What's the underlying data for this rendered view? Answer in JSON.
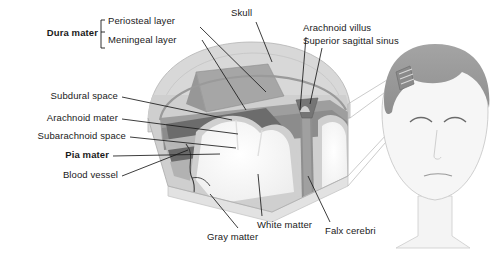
{
  "figure": {
    "background_color": "#ffffff",
    "text_color": "#1a1a1a"
  },
  "palette": {
    "skull_outer": "#d8d8d8",
    "skull_edge": "#bdbdbd",
    "periosteal": "#9a9a9a",
    "meningeal": "#8a8a8a",
    "dura_flap": "#a2a2a2",
    "subdural": "#6e6e6e",
    "arachnoid": "#c2c2c2",
    "subarachnoid": "#5e5e5e",
    "pia": "#b0b0b0",
    "white_matter": "#fbfbfb",
    "gray_matter": "#d2d2d2",
    "falx": "#8f8f8f",
    "sinus": "#7a7a7a",
    "vessel": "#3a3a3a",
    "hair": "#9b9b9b",
    "skin": "#f4f4f4",
    "skin_edge": "#c9c9c9",
    "leader": "#1a1a1a",
    "callout": "#b5b5b5"
  },
  "bracket_group": {
    "title": "Dura mater",
    "items": [
      {
        "label": "Periosteal layer"
      },
      {
        "label": "Meningeal layer"
      }
    ]
  },
  "labels_left": [
    {
      "id": "subdural-space",
      "label": "Subdural space",
      "bold": false
    },
    {
      "id": "arachnoid-mater",
      "label": "Arachnoid mater",
      "bold": false
    },
    {
      "id": "subarachnoid-space",
      "label": "Subarachnoid space",
      "bold": false
    },
    {
      "id": "pia-mater",
      "label": "Pia mater",
      "bold": true
    },
    {
      "id": "blood-vessel",
      "label": "Blood vessel",
      "bold": false
    }
  ],
  "labels_top": [
    {
      "id": "skull",
      "label": "Skull"
    },
    {
      "id": "arachnoid-villus",
      "label": "Arachnoid villus"
    },
    {
      "id": "superior-sagittal-sinus",
      "label": "Superior sagittal sinus"
    }
  ],
  "labels_bottom": [
    {
      "id": "white-matter",
      "label": "White matter"
    },
    {
      "id": "gray-matter",
      "label": "Gray matter"
    },
    {
      "id": "falx-cerebri",
      "label": "Falx cerebri"
    }
  ]
}
